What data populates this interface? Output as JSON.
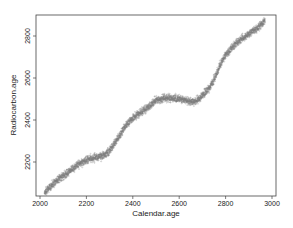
{
  "chart_data": {
    "type": "scatter",
    "title": "",
    "xlabel": "Calendar.age",
    "ylabel": "Radiocarbon.age",
    "xlim": [
      1990,
      3010
    ],
    "ylim": [
      2050,
      2920
    ],
    "xticks": [
      2000,
      2200,
      2400,
      2600,
      2800,
      3000
    ],
    "yticks": [
      2200,
      2400,
      2600,
      2800
    ],
    "grid": false,
    "legend": null,
    "series": [
      {
        "name": "Radiocarbon calibration samples",
        "color": "#7a7a7a",
        "x": [
          2020,
          2050,
          2086,
          2120,
          2160,
          2200,
          2240,
          2280,
          2310,
          2345,
          2370,
          2400,
          2440,
          2470,
          2495,
          2540,
          2570,
          2600,
          2630,
          2660,
          2690,
          2710,
          2733,
          2760,
          2776,
          2800,
          2830,
          2862,
          2895,
          2927,
          2950,
          2970
        ],
        "y": [
          2057,
          2090,
          2124,
          2150,
          2185,
          2210,
          2222,
          2233,
          2270,
          2329,
          2375,
          2410,
          2440,
          2465,
          2490,
          2505,
          2503,
          2500,
          2492,
          2486,
          2505,
          2530,
          2557,
          2615,
          2662,
          2710,
          2748,
          2781,
          2805,
          2829,
          2852,
          2876
        ]
      }
    ]
  },
  "axes": {
    "x_label": "Calendar.age",
    "y_label": "Radiocarbon.age",
    "x_tick_labels": [
      "2000",
      "2200",
      "2400",
      "2600",
      "2800",
      "3000"
    ],
    "y_tick_labels": [
      "2200",
      "2400",
      "2600",
      "2800"
    ]
  }
}
